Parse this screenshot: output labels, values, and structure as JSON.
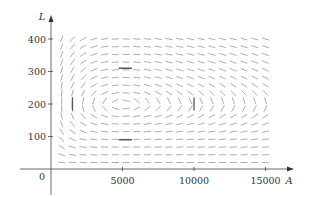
{
  "chart_data": {
    "type": "direction_field",
    "title": "",
    "xlabel": "A",
    "ylabel": "L",
    "origin_label": "0",
    "x_ticks": [
      5000,
      10000,
      15000
    ],
    "x_tick_labels": [
      "5000",
      "10000",
      "15000"
    ],
    "y_ticks": [
      100,
      200,
      300,
      400
    ],
    "y_tick_labels": [
      "100",
      "200",
      "300",
      "400"
    ],
    "xlim": [
      0,
      16500
    ],
    "ylim": [
      0,
      430
    ],
    "grid": false,
    "legend": null,
    "model": {
      "description": "Predator-prey direction field (aphids A, ladybugs L)",
      "dA_dt": "2A - 0.01AL",
      "dL_dt": "-0.5L + 0.0001AL",
      "equilibrium": [
        5000,
        200
      ]
    },
    "field_grid": {
      "A_start": 750,
      "A_step": 750,
      "A_count": 20,
      "L_start": 20,
      "L_step": 23.75,
      "L_count": 17
    },
    "highlighted_segments": [
      {
        "A": 1500,
        "L": 200,
        "orientation": "vertical"
      },
      {
        "A": 5200,
        "L": 310,
        "orientation": "horizontal"
      },
      {
        "A": 10000,
        "L": 200,
        "orientation": "vertical"
      },
      {
        "A": 5200,
        "L": 90,
        "orientation": "horizontal"
      }
    ],
    "colors": {
      "segment": "#8a8a8a",
      "highlight": "#555555",
      "axis": "#444444"
    }
  }
}
